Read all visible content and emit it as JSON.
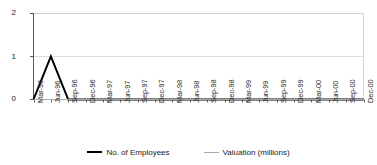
{
  "chart_data": {
    "type": "line",
    "title": "",
    "subtitle": "",
    "xlabel": "",
    "ylabel": "",
    "grid": true,
    "legend_position": "bottom-center",
    "ylim": [
      0,
      2
    ],
    "yticks": [
      "0",
      "1",
      "2"
    ],
    "categories": [
      "Mar-96",
      "Jun-96",
      "Sep-96",
      "Dec-96",
      "Mar-97",
      "Jun-97",
      "Sep-97",
      "Dec-97",
      "Mar-98",
      "Jun-98",
      "Sep-98",
      "Dec-98",
      "Mar-99",
      "Jun-99",
      "Sep-99",
      "Dec-99",
      "Mar-00",
      "Jun-00",
      "Sep-00",
      "Dec-00"
    ],
    "series": [
      {
        "name": "No. of Employees",
        "color": "#000000",
        "values": [
          0,
          1,
          0,
          0,
          0,
          0,
          0,
          0,
          0,
          0,
          0,
          0,
          0,
          0,
          0,
          0,
          0,
          0,
          0,
          0
        ]
      },
      {
        "name": "Valuation (millions)",
        "color": "#a8a8a8",
        "values": [
          0,
          0,
          0,
          0,
          0,
          0,
          0,
          0,
          0,
          0,
          0,
          0,
          0,
          0,
          0,
          0,
          0,
          0,
          0,
          0
        ]
      }
    ]
  },
  "legend": {
    "entries": [
      {
        "label": "No. of Employees"
      },
      {
        "label": "Valuation (millions)"
      }
    ]
  },
  "colors": {
    "axis": "#4d4d4d",
    "grid": "#d9d9d9",
    "plot_border": "#cccccc",
    "background": "#ffffff",
    "series_employees": "#000000",
    "series_valuation": "#a8a8a8"
  }
}
